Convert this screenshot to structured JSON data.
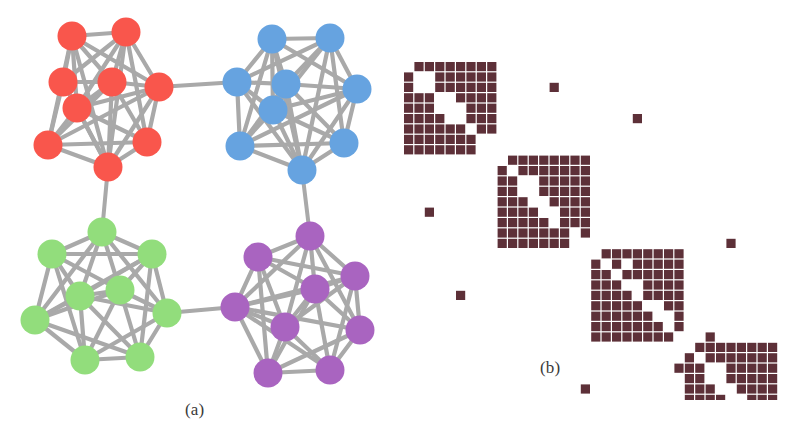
{
  "figure": {
    "caption_a": "(a)",
    "caption_b": "(b)",
    "background_color": "#ffffff"
  },
  "panel_graph": {
    "name": "community-graph",
    "edge_color": "#a9a9a9",
    "edge_width": 4.2,
    "inter_edge_width": 4.0,
    "node_radius": 14.5,
    "clusters": [
      {
        "id": "red",
        "label": "Community 1",
        "color": "#f9564c",
        "nodes": [
          {
            "id": "r0",
            "x": 63,
            "y": 82
          },
          {
            "id": "r1",
            "x": 72,
            "y": 36
          },
          {
            "id": "r2",
            "x": 126,
            "y": 32
          },
          {
            "id": "r3",
            "x": 112,
            "y": 82
          },
          {
            "id": "r4",
            "x": 77,
            "y": 108
          },
          {
            "id": "r5",
            "x": 159,
            "y": 87
          },
          {
            "id": "r6",
            "x": 48,
            "y": 145
          },
          {
            "id": "r7",
            "x": 147,
            "y": 142
          },
          {
            "id": "r8",
            "x": 108,
            "y": 167
          }
        ],
        "edges": [
          [
            0,
            1
          ],
          [
            0,
            2
          ],
          [
            0,
            3
          ],
          [
            0,
            4
          ],
          [
            0,
            6
          ],
          [
            0,
            8
          ],
          [
            1,
            2
          ],
          [
            1,
            3
          ],
          [
            1,
            4
          ],
          [
            1,
            5
          ],
          [
            1,
            6
          ],
          [
            1,
            8
          ],
          [
            2,
            3
          ],
          [
            2,
            4
          ],
          [
            2,
            5
          ],
          [
            2,
            7
          ],
          [
            2,
            8
          ],
          [
            3,
            4
          ],
          [
            3,
            5
          ],
          [
            3,
            6
          ],
          [
            3,
            7
          ],
          [
            3,
            8
          ],
          [
            4,
            5
          ],
          [
            4,
            6
          ],
          [
            4,
            7
          ],
          [
            4,
            8
          ],
          [
            5,
            7
          ],
          [
            5,
            8
          ],
          [
            5,
            6
          ],
          [
            6,
            8
          ],
          [
            6,
            7
          ],
          [
            7,
            8
          ]
        ]
      },
      {
        "id": "blue",
        "label": "Community 2",
        "color": "#66a3e0",
        "nodes": [
          {
            "id": "b0",
            "x": 237,
            "y": 82
          },
          {
            "id": "b1",
            "x": 272,
            "y": 39
          },
          {
            "id": "b2",
            "x": 330,
            "y": 38
          },
          {
            "id": "b3",
            "x": 286,
            "y": 84
          },
          {
            "id": "b4",
            "x": 273,
            "y": 110
          },
          {
            "id": "b5",
            "x": 357,
            "y": 89
          },
          {
            "id": "b6",
            "x": 240,
            "y": 146
          },
          {
            "id": "b7",
            "x": 344,
            "y": 143
          },
          {
            "id": "b8",
            "x": 302,
            "y": 170
          }
        ],
        "edges": [
          [
            0,
            1
          ],
          [
            0,
            2
          ],
          [
            0,
            3
          ],
          [
            0,
            4
          ],
          [
            0,
            6
          ],
          [
            0,
            8
          ],
          [
            1,
            2
          ],
          [
            1,
            3
          ],
          [
            1,
            4
          ],
          [
            1,
            5
          ],
          [
            1,
            6
          ],
          [
            1,
            8
          ],
          [
            2,
            3
          ],
          [
            2,
            4
          ],
          [
            2,
            5
          ],
          [
            2,
            7
          ],
          [
            2,
            8
          ],
          [
            3,
            4
          ],
          [
            3,
            5
          ],
          [
            3,
            6
          ],
          [
            3,
            7
          ],
          [
            3,
            8
          ],
          [
            4,
            5
          ],
          [
            4,
            6
          ],
          [
            4,
            7
          ],
          [
            4,
            8
          ],
          [
            5,
            7
          ],
          [
            5,
            8
          ],
          [
            5,
            6
          ],
          [
            6,
            8
          ],
          [
            6,
            7
          ],
          [
            7,
            8
          ]
        ]
      },
      {
        "id": "green",
        "label": "Community 3",
        "color": "#92dd7c",
        "nodes": [
          {
            "id": "g0",
            "x": 102,
            "y": 232
          },
          {
            "id": "g1",
            "x": 52,
            "y": 254
          },
          {
            "id": "g2",
            "x": 152,
            "y": 254
          },
          {
            "id": "g3",
            "x": 80,
            "y": 296
          },
          {
            "id": "g4",
            "x": 120,
            "y": 290
          },
          {
            "id": "g5",
            "x": 35,
            "y": 320
          },
          {
            "id": "g6",
            "x": 167,
            "y": 313
          },
          {
            "id": "g7",
            "x": 85,
            "y": 360
          },
          {
            "id": "g8",
            "x": 140,
            "y": 357
          }
        ],
        "edges": [
          [
            0,
            1
          ],
          [
            0,
            2
          ],
          [
            0,
            3
          ],
          [
            0,
            4
          ],
          [
            0,
            5
          ],
          [
            0,
            6
          ],
          [
            1,
            2
          ],
          [
            1,
            3
          ],
          [
            1,
            4
          ],
          [
            1,
            5
          ],
          [
            1,
            7
          ],
          [
            2,
            3
          ],
          [
            2,
            4
          ],
          [
            2,
            5
          ],
          [
            2,
            6
          ],
          [
            2,
            8
          ],
          [
            3,
            4
          ],
          [
            3,
            5
          ],
          [
            3,
            6
          ],
          [
            3,
            7
          ],
          [
            3,
            8
          ],
          [
            4,
            5
          ],
          [
            4,
            6
          ],
          [
            4,
            7
          ],
          [
            4,
            8
          ],
          [
            5,
            7
          ],
          [
            5,
            8
          ],
          [
            6,
            7
          ],
          [
            6,
            8
          ],
          [
            7,
            8
          ]
        ]
      },
      {
        "id": "purple",
        "label": "Community 4",
        "color": "#a964c0",
        "nodes": [
          {
            "id": "p0",
            "x": 310,
            "y": 236
          },
          {
            "id": "p1",
            "x": 258,
            "y": 257
          },
          {
            "id": "p2",
            "x": 355,
            "y": 276
          },
          {
            "id": "p3",
            "x": 315,
            "y": 289
          },
          {
            "id": "p4",
            "x": 235,
            "y": 307
          },
          {
            "id": "p5",
            "x": 285,
            "y": 327
          },
          {
            "id": "p6",
            "x": 360,
            "y": 330
          },
          {
            "id": "p7",
            "x": 268,
            "y": 373
          },
          {
            "id": "p8",
            "x": 330,
            "y": 370
          }
        ],
        "edges": [
          [
            0,
            1
          ],
          [
            0,
            2
          ],
          [
            0,
            3
          ],
          [
            0,
            4
          ],
          [
            0,
            5
          ],
          [
            0,
            6
          ],
          [
            1,
            2
          ],
          [
            1,
            3
          ],
          [
            1,
            4
          ],
          [
            1,
            5
          ],
          [
            1,
            7
          ],
          [
            2,
            3
          ],
          [
            2,
            4
          ],
          [
            2,
            5
          ],
          [
            2,
            6
          ],
          [
            2,
            8
          ],
          [
            3,
            4
          ],
          [
            3,
            5
          ],
          [
            3,
            6
          ],
          [
            3,
            7
          ],
          [
            3,
            8
          ],
          [
            4,
            5
          ],
          [
            4,
            6
          ],
          [
            4,
            7
          ],
          [
            4,
            8
          ],
          [
            5,
            7
          ],
          [
            5,
            8
          ],
          [
            6,
            7
          ],
          [
            6,
            8
          ],
          [
            7,
            8
          ]
        ]
      }
    ],
    "inter_cluster_edges": [
      {
        "from": "red.5",
        "to": "blue.0",
        "label": "red-blue-bridge"
      },
      {
        "from": "red.8",
        "to": "green.0",
        "label": "red-green-bridge"
      },
      {
        "from": "blue.8",
        "to": "purple.0",
        "label": "blue-purple-bridge"
      },
      {
        "from": "green.6",
        "to": "purple.4",
        "label": "green-purple-bridge"
      }
    ]
  },
  "panel_matrix": {
    "name": "adjacency-matrix",
    "cell_color": "#5d3038",
    "cell_size": 9.2,
    "cell_gap": 1.2,
    "origin_x": 16,
    "origin_y": 62,
    "n": 36,
    "block_size": 9,
    "blocks": [
      {
        "id": "block-1",
        "community": "red",
        "row_start": 0,
        "col_start": 0,
        "pattern": [
          [
            0,
            1,
            1,
            1,
            1,
            1,
            1,
            1,
            1
          ],
          [
            1,
            0,
            0,
            1,
            1,
            1,
            1,
            1,
            1
          ],
          [
            1,
            0,
            0,
            1,
            1,
            1,
            1,
            1,
            1
          ],
          [
            1,
            1,
            1,
            0,
            0,
            1,
            1,
            1,
            1
          ],
          [
            1,
            1,
            1,
            0,
            0,
            0,
            1,
            1,
            1
          ],
          [
            1,
            1,
            1,
            1,
            0,
            0,
            1,
            1,
            1
          ],
          [
            1,
            1,
            1,
            1,
            1,
            1,
            0,
            1,
            1
          ],
          [
            1,
            1,
            1,
            1,
            1,
            1,
            1,
            0,
            0
          ],
          [
            1,
            1,
            1,
            1,
            1,
            1,
            1,
            0,
            0
          ]
        ]
      },
      {
        "id": "block-2",
        "community": "blue",
        "row_start": 9,
        "col_start": 9,
        "pattern": [
          [
            0,
            1,
            1,
            1,
            1,
            1,
            1,
            1,
            1
          ],
          [
            1,
            0,
            1,
            1,
            1,
            1,
            1,
            1,
            1
          ],
          [
            1,
            1,
            0,
            0,
            1,
            1,
            1,
            1,
            1
          ],
          [
            1,
            1,
            0,
            0,
            1,
            1,
            1,
            1,
            1
          ],
          [
            1,
            1,
            1,
            0,
            0,
            1,
            1,
            1,
            1
          ],
          [
            1,
            1,
            1,
            1,
            0,
            0,
            1,
            1,
            1
          ],
          [
            1,
            1,
            1,
            1,
            1,
            0,
            1,
            1,
            1
          ],
          [
            1,
            1,
            1,
            1,
            1,
            1,
            1,
            0,
            1
          ],
          [
            1,
            1,
            1,
            1,
            1,
            1,
            1,
            0,
            0
          ]
        ]
      },
      {
        "id": "block-3",
        "community": "green",
        "row_start": 18,
        "col_start": 18,
        "pattern": [
          [
            0,
            1,
            1,
            1,
            1,
            1,
            1,
            1,
            1
          ],
          [
            1,
            0,
            1,
            0,
            1,
            1,
            1,
            1,
            1
          ],
          [
            1,
            1,
            0,
            1,
            1,
            1,
            1,
            1,
            1
          ],
          [
            1,
            1,
            1,
            0,
            0,
            1,
            1,
            1,
            1
          ],
          [
            1,
            1,
            1,
            1,
            0,
            1,
            1,
            1,
            1
          ],
          [
            1,
            1,
            1,
            1,
            1,
            0,
            0,
            1,
            1
          ],
          [
            1,
            1,
            1,
            1,
            1,
            1,
            0,
            0,
            1
          ],
          [
            1,
            1,
            1,
            1,
            1,
            1,
            1,
            0,
            1
          ],
          [
            1,
            1,
            1,
            1,
            1,
            1,
            1,
            1,
            0
          ]
        ]
      },
      {
        "id": "block-4",
        "community": "purple",
        "row_start": 27,
        "col_start": 27,
        "pattern": [
          [
            0,
            1,
            1,
            1,
            1,
            1,
            1,
            1,
            1
          ],
          [
            1,
            0,
            1,
            1,
            1,
            1,
            1,
            1,
            1
          ],
          [
            1,
            1,
            0,
            0,
            1,
            1,
            1,
            1,
            1
          ],
          [
            1,
            1,
            0,
            0,
            1,
            1,
            1,
            1,
            1
          ],
          [
            1,
            1,
            1,
            0,
            0,
            1,
            1,
            1,
            1
          ],
          [
            1,
            1,
            1,
            1,
            0,
            0,
            1,
            1,
            1
          ],
          [
            1,
            1,
            1,
            1,
            1,
            0,
            1,
            1,
            1
          ],
          [
            1,
            1,
            1,
            1,
            1,
            1,
            0,
            1,
            1
          ],
          [
            1,
            1,
            1,
            1,
            1,
            1,
            1,
            0,
            1
          ]
        ]
      }
    ],
    "off_diagonal_cells": [
      {
        "row": 2,
        "col": 14,
        "label": "red-blue-link"
      },
      {
        "row": 5,
        "col": 22,
        "label": "red-green-link"
      },
      {
        "row": 14,
        "col": 2,
        "label": "blue-red-link"
      },
      {
        "row": 17,
        "col": 31,
        "label": "blue-purple-link"
      },
      {
        "row": 22,
        "col": 5,
        "label": "green-red-link"
      },
      {
        "row": 26,
        "col": 29,
        "label": "green-purple-link"
      },
      {
        "row": 29,
        "col": 26,
        "label": "purple-green-link"
      },
      {
        "row": 31,
        "col": 17,
        "label": "purple-blue-link"
      }
    ]
  }
}
